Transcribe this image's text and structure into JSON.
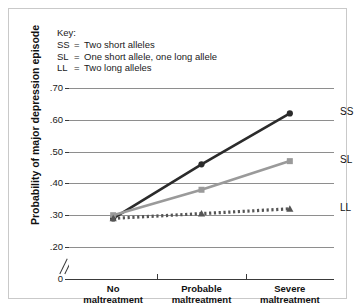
{
  "key": {
    "title": "Key:",
    "entries": [
      {
        "code": "SS",
        "eq": "=",
        "text": "Two short alleles"
      },
      {
        "code": "SL",
        "eq": "=",
        "text": "One short allele, one long allele"
      },
      {
        "code": "LL",
        "eq": "=",
        "text": "Two long alleles"
      }
    ]
  },
  "axes": {
    "ylabel": "Probability of major depression episode",
    "yticklabels": [
      ".70",
      ".60",
      ".50",
      ".40",
      ".30",
      ".20",
      "0"
    ],
    "xticklabels_line1": [
      "No",
      "Probable",
      "Severe"
    ],
    "xticklabels_line2": [
      "maltreatment",
      "maltreatment",
      "maltreatment"
    ]
  },
  "series_labels": {
    "ss": "SS",
    "sl": "SL",
    "ll": "LL"
  },
  "colors": {
    "ss": "#2b2b2b",
    "sl": "#9a9a9a",
    "ll": "#555555",
    "grid": "#8e8e8e",
    "axis": "#3a3a3a",
    "frame": "#c9c9c9"
  },
  "chart_data": {
    "type": "line",
    "title": "",
    "xlabel": "",
    "ylabel": "Probability of major depression episode",
    "categories": [
      "No maltreatment",
      "Probable maltreatment",
      "Severe maltreatment"
    ],
    "ylim": [
      0.2,
      0.7
    ],
    "yticks": [
      0.2,
      0.3,
      0.4,
      0.5,
      0.6,
      0.7
    ],
    "ytick_labels": [
      ".20",
      ".30",
      ".40",
      ".50",
      ".60",
      ".70"
    ],
    "y_axis_has_break": true,
    "y_axis_origin_label": "0",
    "grid": "horizontal",
    "legend": "inline-right-labels",
    "series": [
      {
        "name": "SS",
        "description": "Two short alleles",
        "values": [
          0.29,
          0.46,
          0.62
        ],
        "color": "#2b2b2b",
        "linestyle": "solid",
        "marker": "circle"
      },
      {
        "name": "SL",
        "description": "One short allele, one long allele",
        "values": [
          0.3,
          0.38,
          0.47
        ],
        "color": "#9a9a9a",
        "linestyle": "solid",
        "marker": "square"
      },
      {
        "name": "LL",
        "description": "Two long alleles",
        "values": [
          0.29,
          0.305,
          0.32
        ],
        "color": "#555555",
        "linestyle": "dotted",
        "marker": "triangle"
      }
    ]
  }
}
